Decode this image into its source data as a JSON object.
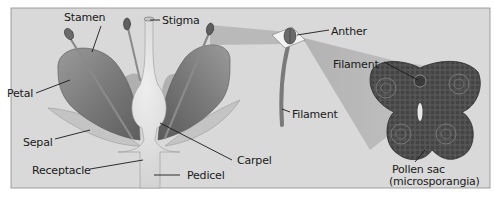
{
  "diagram": {
    "style": "grayscale textbook illustration",
    "colors": {
      "background": "#d9d9d9",
      "panel_border": "#8a8a8a",
      "petal_dark": "#6e6e6e",
      "petal_light": "#a9a9a9",
      "carpel": "#e2e2e2",
      "sepal": "#c4c4c4",
      "anther_section": "#4a4a4a",
      "zoom_beam": "#b0b0b0",
      "label_text": "#1a1a1a"
    },
    "flower_labels": {
      "stamen": "Stamen",
      "stigma": "Stigma",
      "petal": "Petal",
      "sepal": "Sepal",
      "receptacle": "Receptacle",
      "pedicel": "Pedicel",
      "carpel": "Carpel"
    },
    "stamen_detail_labels": {
      "anther": "Anther",
      "filament": "Filament"
    },
    "cross_section_labels": {
      "filament": "Filament",
      "pollen_sac_line1": "Pollen sac",
      "pollen_sac_line2": "(microsporangia)"
    }
  }
}
